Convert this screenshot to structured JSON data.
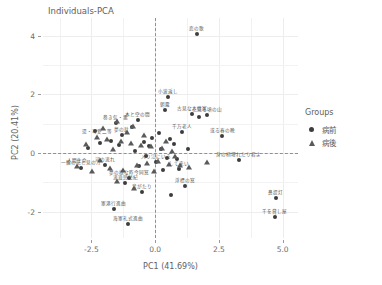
{
  "chart_data": {
    "type": "scatter",
    "title": "Individuals-PCA",
    "xlabel": "PC1 (41.69%)",
    "ylabel": "PC2 (20.41%)",
    "xlim": [
      -4.4,
      5.6
    ],
    "ylim": [
      -2.9,
      4.6
    ],
    "xticks": [
      -2.5,
      0.0,
      2.5,
      5.0
    ],
    "xticklabels": [
      "-2.5",
      "0.0",
      "2.5",
      "5.0"
    ],
    "yticks": [
      -2,
      0,
      2,
      4
    ],
    "yticklabels": [
      "-2",
      "0",
      "2",
      "4"
    ],
    "grid": true,
    "reference_lines": {
      "vertical_x": 0.0,
      "horizontal_y": 0.0,
      "style": "dashed"
    },
    "legend": {
      "title": "Groups",
      "position": "right",
      "entries": [
        {
          "label": "病前",
          "marker": "circle",
          "color": "#3d3d3d"
        },
        {
          "label": "病後",
          "marker": "triangle",
          "color": "#5a5a5a"
        }
      ]
    },
    "series": [
      {
        "name": "病前",
        "marker": "circle",
        "color": "#3d3d3d",
        "points": [
          {
            "x": 1.62,
            "y": 4.05,
            "label": "恋の歌"
          },
          {
            "x": 0.52,
            "y": 1.92,
            "label": "小波返し"
          },
          {
            "x": 1.45,
            "y": 1.32,
            "label": "古見な人情家"
          },
          {
            "x": 2.05,
            "y": 1.28,
            "label": "花見る頃の山"
          },
          {
            "x": 1.05,
            "y": 0.72,
            "label": "千万老人"
          },
          {
            "x": 2.62,
            "y": 0.58,
            "label": "或る春の晩"
          },
          {
            "x": 1.72,
            "y": 1.22,
            "label": ""
          },
          {
            "x": 0.38,
            "y": 1.48,
            "label": "朝露"
          },
          {
            "x": 3.28,
            "y": -0.25,
            "label": "身の柄埋れたり君よ"
          },
          {
            "x": 4.72,
            "y": -1.52,
            "label": "鼻提灯"
          },
          {
            "x": 4.68,
            "y": -2.18,
            "label": "千を貸し屋"
          },
          {
            "x": -1.62,
            "y": -1.92,
            "label": "軍港行進曲"
          },
          {
            "x": -1.08,
            "y": -2.42,
            "label": "海軍礼式進曲"
          },
          {
            "x": 1.18,
            "y": -1.12,
            "label": "浮標の窓"
          },
          {
            "x": 0.62,
            "y": -1.45,
            "label": ""
          },
          {
            "x": -0.52,
            "y": -1.32,
            "label": "音がたり"
          },
          {
            "x": 0.92,
            "y": -0.55,
            "label": "して来い"
          },
          {
            "x": -1.02,
            "y": -0.85,
            "label": "夢の様な昨今同窓"
          },
          {
            "x": -1.18,
            "y": -1.02,
            "label": "流浪児愁紀"
          },
          {
            "x": -2.92,
            "y": -0.52,
            "label": "一輪の花と見の汀"
          },
          {
            "x": -1.95,
            "y": -0.42,
            "label": "河の流れ"
          },
          {
            "x": 0.05,
            "y": -0.32,
            "label": "入り江にいる"
          },
          {
            "x": -0.25,
            "y": 0.22,
            "label": ""
          },
          {
            "x": -0.45,
            "y": 0.38,
            "label": ""
          },
          {
            "x": 0.22,
            "y": 0.12,
            "label": ""
          },
          {
            "x": 0.48,
            "y": -0.18,
            "label": ""
          },
          {
            "x": -0.78,
            "y": 0.05,
            "label": ""
          },
          {
            "x": -1.42,
            "y": 0.28,
            "label": ""
          },
          {
            "x": -1.72,
            "y": 0.42,
            "label": ""
          },
          {
            "x": -2.18,
            "y": 0.35,
            "label": ""
          },
          {
            "x": 0.72,
            "y": 0.32,
            "label": ""
          },
          {
            "x": -0.12,
            "y": 0.52,
            "label": ""
          },
          {
            "x": 0.85,
            "y": -0.22,
            "label": ""
          },
          {
            "x": -0.62,
            "y": -0.45,
            "label": ""
          },
          {
            "x": 0.32,
            "y": -0.58,
            "label": ""
          },
          {
            "x": -1.32,
            "y": 0.62,
            "label": "夢の針"
          },
          {
            "x": -2.35,
            "y": 0.75,
            "label": ""
          },
          {
            "x": -0.92,
            "y": 0.88,
            "label": ""
          },
          {
            "x": -1.55,
            "y": 1.02,
            "label": "巻き気・悪"
          },
          {
            "x": -0.68,
            "y": 1.12,
            "label": "木と空の間"
          },
          {
            "x": 0.15,
            "y": 0.68,
            "label": ""
          },
          {
            "x": 0.58,
            "y": 0.48,
            "label": ""
          },
          {
            "x": 1.28,
            "y": 0.15,
            "label": ""
          },
          {
            "x": -0.35,
            "y": -0.12,
            "label": ""
          },
          {
            "x": -2.62,
            "y": 0.18,
            "label": ""
          }
        ]
      },
      {
        "name": "病後",
        "marker": "triangle",
        "color": "#5a5a5a",
        "points": [
          {
            "x": -1.48,
            "y": 1.08,
            "label": ""
          },
          {
            "x": -0.88,
            "y": 0.92,
            "label": ""
          },
          {
            "x": -2.28,
            "y": 0.55,
            "label": "湯・可愛二等"
          },
          {
            "x": -1.88,
            "y": 0.48,
            "label": ""
          },
          {
            "x": -1.35,
            "y": 0.42,
            "label": ""
          },
          {
            "x": -0.95,
            "y": 0.35,
            "label": ""
          },
          {
            "x": -0.55,
            "y": 0.28,
            "label": ""
          },
          {
            "x": -0.15,
            "y": 0.25,
            "label": ""
          },
          {
            "x": 0.25,
            "y": 0.18,
            "label": ""
          },
          {
            "x": 0.65,
            "y": 0.08,
            "label": ""
          },
          {
            "x": -3.05,
            "y": -0.45,
            "label": "人間生命"
          },
          {
            "x": -2.48,
            "y": -0.62,
            "label": ""
          },
          {
            "x": -1.78,
            "y": -0.52,
            "label": ""
          },
          {
            "x": -1.25,
            "y": -0.58,
            "label": ""
          },
          {
            "x": -0.72,
            "y": -0.42,
            "label": ""
          },
          {
            "x": -0.32,
            "y": -0.35,
            "label": ""
          },
          {
            "x": 0.12,
            "y": -0.28,
            "label": ""
          },
          {
            "x": 0.55,
            "y": -0.38,
            "label": ""
          },
          {
            "x": 0.98,
            "y": -0.42,
            "label": ""
          },
          {
            "x": -0.82,
            "y": -1.18,
            "label": ""
          },
          {
            "x": -1.48,
            "y": -0.95,
            "label": ""
          },
          {
            "x": 2.05,
            "y": -0.32,
            "label": ""
          },
          {
            "x": -2.05,
            "y": 0.85,
            "label": ""
          },
          {
            "x": -1.12,
            "y": 0.72,
            "label": ""
          },
          {
            "x": -0.42,
            "y": 0.62,
            "label": ""
          },
          {
            "x": 0.42,
            "y": 0.42,
            "label": ""
          },
          {
            "x": -2.72,
            "y": 0.32,
            "label": ""
          },
          {
            "x": 0.78,
            "y": -0.12,
            "label": ""
          },
          {
            "x": 1.32,
            "y": -0.48,
            "label": ""
          },
          {
            "x": -0.05,
            "y": -0.62,
            "label": ""
          },
          {
            "x": -1.65,
            "y": 0.15,
            "label": ""
          },
          {
            "x": -2.15,
            "y": -0.25,
            "label": ""
          }
        ]
      }
    ]
  }
}
